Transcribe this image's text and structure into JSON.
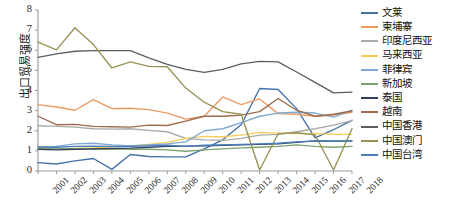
{
  "chart_data": {
    "type": "line",
    "title": "",
    "xlabel": "",
    "ylabel": "出口贸易强度",
    "ylim": [
      0,
      8
    ],
    "ytick_step": 1,
    "yticks": [
      "8",
      "7",
      "6",
      "5",
      "4",
      "3",
      "2",
      "1",
      "0"
    ],
    "grid": false,
    "legend_position": "right",
    "x": [
      "2001",
      "2002",
      "2003",
      "2004",
      "2005",
      "2006",
      "2007",
      "2008",
      "2009",
      "2010",
      "2011",
      "2012",
      "2013",
      "2014",
      "2015",
      "2016",
      "2017",
      "2018"
    ],
    "series": [
      {
        "name": "文莱",
        "color": "#4472a8",
        "values": [
          0.42,
          0.35,
          0.5,
          0.62,
          0.08,
          0.82,
          0.72,
          0.7,
          0.7,
          1.1,
          1.55,
          2.3,
          4.1,
          4.05,
          3.1,
          1.65,
          2.05,
          2.52
        ]
      },
      {
        "name": "柬埔寨",
        "color": "#ed9a63",
        "values": [
          3.3,
          3.18,
          3.02,
          3.55,
          3.1,
          3.12,
          3.05,
          2.88,
          2.58,
          2.72,
          3.68,
          3.3,
          3.58,
          2.85,
          2.82,
          2.72,
          2.78,
          2.92
        ]
      },
      {
        "name": "印度尼西亚",
        "color": "#aaaaaa",
        "values": [
          2.25,
          2.22,
          2.18,
          2.1,
          2.08,
          2.1,
          2.02,
          1.95,
          1.62,
          1.55,
          1.52,
          1.62,
          1.78,
          1.82,
          1.95,
          2.1,
          2.28,
          2.5
        ]
      },
      {
        "name": "马来西亚",
        "color": "#f5cc5a",
        "values": [
          1.12,
          1.1,
          1.12,
          1.15,
          1.2,
          1.25,
          1.32,
          1.42,
          1.62,
          1.72,
          1.7,
          1.78,
          1.92,
          1.88,
          1.86,
          1.86,
          1.82,
          1.82
        ]
      },
      {
        "name": "菲律宾",
        "color": "#7fa9d4",
        "values": [
          1.18,
          1.22,
          1.35,
          1.38,
          1.3,
          1.25,
          1.3,
          1.35,
          1.45,
          2.0,
          2.1,
          2.4,
          2.72,
          2.88,
          2.92,
          2.88,
          2.68,
          3.02
        ]
      },
      {
        "name": "新加坡",
        "color": "#7aa36e",
        "values": [
          1.15,
          1.12,
          1.1,
          1.08,
          1.1,
          1.08,
          1.08,
          1.05,
          0.98,
          1.05,
          1.1,
          1.15,
          1.18,
          1.22,
          1.3,
          1.22,
          1.18,
          1.22
        ]
      },
      {
        "name": "泰国",
        "color": "#33415c",
        "values": [
          1.08,
          1.05,
          1.08,
          1.1,
          1.12,
          1.14,
          1.18,
          1.22,
          1.24,
          1.25,
          1.28,
          1.3,
          1.32,
          1.35,
          1.42,
          1.5,
          1.48,
          1.5
        ]
      },
      {
        "name": "越南",
        "color": "#9c6b4e",
        "values": [
          2.72,
          2.3,
          2.32,
          2.22,
          2.2,
          2.18,
          2.28,
          2.26,
          2.48,
          2.72,
          2.72,
          2.78,
          2.95,
          3.6,
          3.02,
          2.72,
          2.82,
          2.98
        ]
      },
      {
        "name": "中国香港",
        "color": "#5a5f63",
        "values": [
          5.65,
          5.82,
          5.95,
          5.98,
          5.98,
          5.98,
          5.62,
          5.3,
          5.05,
          4.9,
          5.05,
          5.32,
          5.45,
          5.42,
          4.92,
          4.4,
          3.88,
          3.92
        ]
      },
      {
        "name": "中国澳门",
        "color": "#9a9154",
        "values": [
          6.4,
          6.02,
          7.12,
          6.28,
          5.12,
          5.42,
          5.2,
          5.18,
          4.12,
          3.42,
          2.95,
          2.82,
          0.05,
          1.85,
          1.9,
          1.8,
          0.05,
          2.1
        ]
      },
      {
        "name": "中国台湾",
        "color": "#4a7ebb",
        "values": [
          1.2,
          1.18,
          1.22,
          1.24,
          1.22,
          1.22,
          1.25,
          1.28,
          1.22,
          1.28,
          1.3,
          1.32,
          1.35,
          1.38,
          1.45,
          1.5,
          1.48,
          1.5
        ]
      }
    ]
  }
}
